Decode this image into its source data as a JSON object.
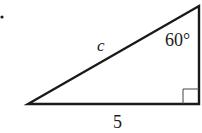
{
  "diagram": {
    "type": "right-triangle",
    "labels": {
      "hypotenuse": "c",
      "angle": "60°",
      "base": "5"
    },
    "right_angle_marker": true,
    "bullet": "•",
    "colors": {
      "stroke": "#1a1a1a",
      "background": "#ffffff"
    }
  }
}
